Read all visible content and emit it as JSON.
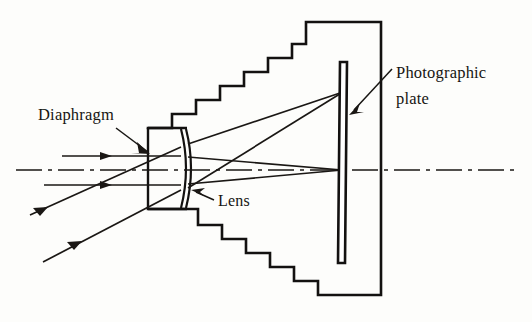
{
  "figure": {
    "background_color": "#fdfdfb",
    "ink_color": "#131110"
  },
  "labels": {
    "diaphragm": {
      "text": "Diaphragm",
      "x": 38,
      "y": 120
    },
    "lens": {
      "text": "Lens",
      "x": 218,
      "y": 206
    },
    "photographic_plate": {
      "line1": "Photographic",
      "line2": "plate",
      "x": 396,
      "y1": 78,
      "y2": 104
    }
  },
  "components": {
    "camera_body": {
      "name": "stepped-camera-body",
      "top_steps": 7,
      "bottom_steps": 6,
      "right_edge_x": 381,
      "top_y": 22,
      "bottom_y": 295
    },
    "lens_housing": {
      "name": "lens-housing",
      "left_x": 148,
      "right_x": 187,
      "top_y": 128,
      "bottom_y": 209
    },
    "lens_element": {
      "name": "meniscus-lens",
      "curvature": "convex-right",
      "apex_x": 193,
      "top_y": 129,
      "bottom_y": 208
    },
    "photographic_plate": {
      "name": "photographic-plate",
      "top_x": 344,
      "top_y": 62,
      "bottom_x": 338,
      "bottom_y": 263,
      "thickness": 7
    },
    "optical_axis": {
      "name": "optical-axis",
      "y": 170,
      "from_x": 16,
      "to_x": 516,
      "style": "dash-dot"
    }
  },
  "rays": {
    "on_axis_bundle": {
      "count": 2,
      "direction": "left-to-right horizontal",
      "converge_x": 342,
      "converge_y": 170,
      "entry_ys": [
        156,
        185
      ]
    },
    "oblique_bundle": {
      "count": 2,
      "direction": "lower-left to upper-right",
      "converge_x": 343,
      "converge_y": 92,
      "start_points": [
        [
          30,
          215
        ],
        [
          43,
          262
        ]
      ]
    }
  }
}
